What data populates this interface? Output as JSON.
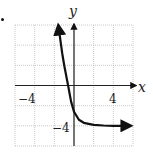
{
  "chart_data": {
    "type": "line",
    "title": "",
    "xlabel": "x",
    "ylabel": "y",
    "xlim": [
      -6,
      6
    ],
    "ylim": [
      -6,
      6
    ],
    "grid": true,
    "grid_step": 2,
    "tick_labels": {
      "x": [
        "-4",
        "4"
      ],
      "y": [
        "-4"
      ]
    },
    "asymptote": {
      "type": "horizontal",
      "y": -4
    },
    "series": [
      {
        "name": "curve",
        "description": "decreasing exponential approaching y=-4 as x increases; arrows at both ends",
        "x": [
          -1.6,
          -1.2,
          -1.0,
          -0.6,
          -0.3,
          0.0,
          0.5,
          1.0,
          2.0,
          3.0,
          4.0,
          5.8
        ],
        "y": [
          6.0,
          3.2,
          2.0,
          0.0,
          -1.6,
          -2.6,
          -3.4,
          -3.7,
          -3.9,
          -3.97,
          -4.0,
          -4.0
        ]
      }
    ]
  },
  "labels": {
    "x_axis": "x",
    "y_axis": "y",
    "x_neg4": "−4",
    "x_pos4": "4",
    "y_neg4": "−4"
  }
}
